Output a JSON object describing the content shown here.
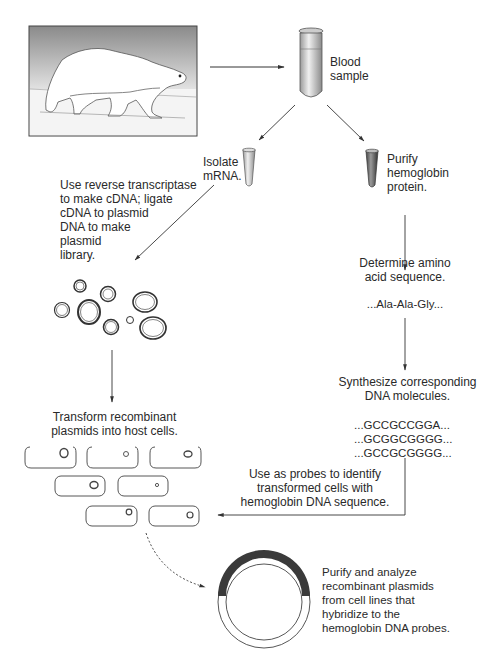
{
  "diagram": {
    "illustration": "polar-bear",
    "steps": {
      "blood_sample": "Blood\nsample",
      "isolate_mrna": "Isolate\nmRNA.",
      "purify_hemoglobin": "Purify\nhemoglobin\nprotein.",
      "reverse_transcriptase": "Use reverse transcriptase\nto make cDNA; ligate\ncDNA to plasmid\nDNA to make\nplasmid\nlibrary.",
      "determine_sequence": "Determine amino\nacid sequence.",
      "amino_acid_sequence": "...Ala-Ala-Gly...",
      "synthesize_dna": "Synthesize corresponding\nDNA molecules.",
      "dna_sequences": [
        "...GCCGCCGGA...",
        "...GCGGCGGGG...",
        "...GCCGCGGGG..."
      ],
      "transform": "Transform recombinant\nplasmids into host cells.",
      "use_as_probes": "Use as probes to identify\ntransformed cells with\nhemoglobin DNA sequence.",
      "purify_analyze": "Purify and analyze\nrecombinant plasmids\nfrom cell lines that\nhybridize to the\nhemoglobin DNA probes."
    },
    "colors": {
      "line": "#333333",
      "plasmid_insert": "#3a3a3a",
      "tube_blood": "#555555"
    }
  }
}
